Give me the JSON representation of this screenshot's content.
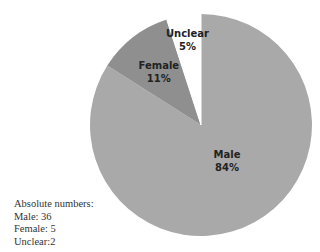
{
  "chart_data": {
    "type": "pie",
    "title": "",
    "slices": [
      {
        "label": "Male",
        "value": 84,
        "display": "84%",
        "count": 36,
        "color": "#a9a9a9"
      },
      {
        "label": "Female",
        "value": 11,
        "display": "11%",
        "count": 5,
        "color": "#8f8f8f"
      },
      {
        "label": "Unclear",
        "value": 5,
        "display": "5%",
        "count": 2,
        "color": "#ffffff"
      }
    ],
    "start": "12 o'clock",
    "direction": "clockwise",
    "legend": "none"
  },
  "notes": {
    "heading": "Absolute numbers:",
    "lines": [
      "Male: 36",
      "Female: 5",
      "Unclear:2"
    ]
  }
}
